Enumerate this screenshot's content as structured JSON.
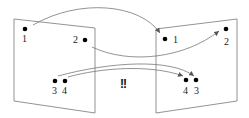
{
  "diagram": {
    "left_plane": {
      "points": [
        {
          "label": "1"
        },
        {
          "label": "2"
        },
        {
          "label": "3"
        },
        {
          "label": "4"
        }
      ]
    },
    "right_plane": {
      "points": [
        {
          "label": "1"
        },
        {
          "label": "2"
        },
        {
          "label": "4"
        },
        {
          "label": "3"
        }
      ]
    },
    "annotation": "!!",
    "colors": {
      "line": "#777777",
      "dot": "#000000"
    }
  }
}
